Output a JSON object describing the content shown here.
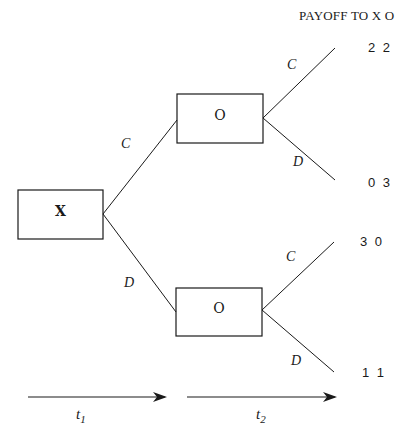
{
  "header": {
    "title": "PAYOFF TO X  O"
  },
  "nodes": {
    "root": {
      "label": "X"
    },
    "upper": {
      "label": "O"
    },
    "lower": {
      "label": "O"
    }
  },
  "branches": {
    "root_upper": "C",
    "root_lower": "D",
    "upper_c": "C",
    "upper_d": "D",
    "lower_c": "C",
    "lower_d": "D"
  },
  "payoffs": [
    {
      "path": "C,C",
      "value": "2 2"
    },
    {
      "path": "C,D",
      "value": "0 3"
    },
    {
      "path": "D,C",
      "value": "3 0"
    },
    {
      "path": "D,D",
      "value": "1 1"
    }
  ],
  "timeline": {
    "t1": {
      "base": "t",
      "sub": "1"
    },
    "t2": {
      "base": "t",
      "sub": "2"
    }
  },
  "colors": {
    "ink": "#1a1a1a",
    "background": "#ffffff"
  }
}
